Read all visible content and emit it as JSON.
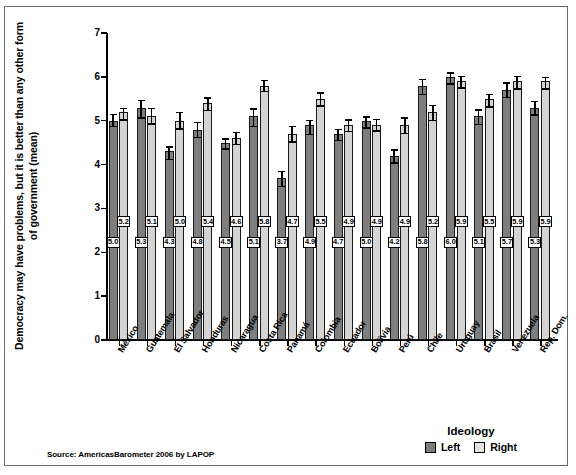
{
  "chart_data": {
    "type": "bar",
    "title": "",
    "xlabel": "",
    "ylabel": "Democracy may have problems, but it is better than any other form of government (mean)",
    "ylim": [
      0,
      7
    ],
    "yticks": [
      "0",
      "1",
      "2",
      "3",
      "4",
      "5",
      "6",
      "7"
    ],
    "grid": false,
    "legend_title": "Ideology",
    "legend_position": "bottom-right",
    "categories": [
      "México",
      "Guatemala",
      "El Salvador",
      "Honduras",
      "Nicaragua",
      "Costa Rica",
      "Panamá",
      "Colombia",
      "Ecuador",
      "Bolivia",
      "Perú",
      "Chile",
      "Uruguay",
      "Brasil",
      "Venezuela",
      "Rep. Dom."
    ],
    "series": [
      {
        "name": "Left",
        "color": "#7e7e7e",
        "values": [
          5.0,
          5.3,
          4.3,
          4.8,
          4.5,
          5.1,
          3.7,
          4.9,
          4.7,
          5.0,
          4.2,
          5.8,
          6.0,
          5.1,
          5.7,
          5.3
        ],
        "labels": [
          "5.0",
          "5.3",
          "4.3",
          "4.8",
          "4.5",
          "5.1",
          "3.7",
          "4.9",
          "4.7",
          "5.0",
          "4.2",
          "5.8",
          "6.0",
          "5.1",
          "5.7",
          "5.3"
        ],
        "err_low": [
          4.88,
          5.08,
          4.13,
          4.63,
          4.37,
          4.88,
          3.52,
          4.7,
          4.56,
          4.85,
          4.05,
          5.62,
          5.85,
          4.93,
          5.55,
          5.15
        ],
        "err_high": [
          5.16,
          5.47,
          4.42,
          4.98,
          4.6,
          5.28,
          3.86,
          5.02,
          4.82,
          5.1,
          4.35,
          5.95,
          6.1,
          5.26,
          5.88,
          5.45
        ]
      },
      {
        "name": "Right",
        "color": "#d4d4d4",
        "values": [
          5.2,
          5.1,
          5.0,
          5.4,
          4.6,
          5.8,
          4.7,
          5.5,
          4.9,
          4.9,
          4.9,
          5.2,
          5.9,
          5.5,
          5.9,
          5.9
        ],
        "labels": [
          "5.2",
          "5.1",
          "5.0",
          "5.4",
          "4.6",
          "5.8",
          "4.7",
          "5.5",
          "4.9",
          "4.9",
          "4.9",
          "5.2",
          "5.9",
          "5.5",
          "5.9",
          "5.9"
        ],
        "err_low": [
          5.03,
          4.94,
          4.83,
          5.25,
          4.47,
          5.68,
          4.53,
          5.35,
          4.77,
          4.78,
          4.72,
          5.02,
          5.76,
          5.33,
          5.74,
          5.74
        ],
        "err_high": [
          5.3,
          5.3,
          5.2,
          5.53,
          4.75,
          5.93,
          4.88,
          5.65,
          5.03,
          5.04,
          5.08,
          5.36,
          6.03,
          5.62,
          6.02,
          6.0
        ]
      }
    ]
  },
  "legend": {
    "title": "Ideology",
    "items": [
      {
        "label": "Left",
        "color": "#7e7e7e"
      },
      {
        "label": "Right",
        "color": "#e2e2e2"
      }
    ]
  },
  "source": {
    "text": "Source: AmericasBarometer 2006 by LAPOP"
  }
}
